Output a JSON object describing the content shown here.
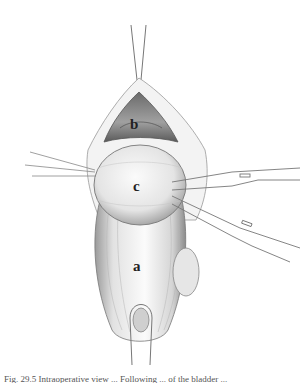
{
  "figure": {
    "labels": {
      "a": "a",
      "b": "b",
      "c": "c"
    },
    "caption": "Fig. 29.5 Intraoperative view ... Following ... of the bladder ..."
  }
}
